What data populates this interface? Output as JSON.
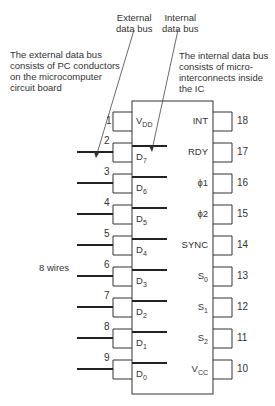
{
  "annotations": {
    "external_bus_label": [
      "External",
      "data bus"
    ],
    "internal_bus_label": [
      "Internal",
      "data bus"
    ],
    "external_note": [
      "The external data bus",
      "consists of PC conductors",
      "on the microcomputer",
      "circuit board"
    ],
    "internal_note": [
      "The internal data bus",
      "consists of micro-",
      "interconnects inside",
      "the IC"
    ],
    "wires_label": "8 wires"
  },
  "chip": {
    "left_pins": [
      {
        "num": "1",
        "name": "V",
        "sub": "DD"
      },
      {
        "num": "2",
        "name": "D",
        "sub": "7"
      },
      {
        "num": "3",
        "name": "D",
        "sub": "6"
      },
      {
        "num": "4",
        "name": "D",
        "sub": "5"
      },
      {
        "num": "5",
        "name": "D",
        "sub": "4"
      },
      {
        "num": "6",
        "name": "D",
        "sub": "3"
      },
      {
        "num": "7",
        "name": "D",
        "sub": "2"
      },
      {
        "num": "8",
        "name": "D",
        "sub": "1"
      },
      {
        "num": "9",
        "name": "D",
        "sub": "0"
      }
    ],
    "right_pins": [
      {
        "num": "18",
        "name": "INT",
        "sub": ""
      },
      {
        "num": "17",
        "name": "RDY",
        "sub": ""
      },
      {
        "num": "16",
        "name": "ϕ1",
        "sub": ""
      },
      {
        "num": "15",
        "name": "ϕ2",
        "sub": ""
      },
      {
        "num": "14",
        "name": "SYNC",
        "sub": ""
      },
      {
        "num": "13",
        "name": "S",
        "sub": "0"
      },
      {
        "num": "12",
        "name": "S",
        "sub": "1"
      },
      {
        "num": "11",
        "name": "S",
        "sub": "2"
      },
      {
        "num": "10",
        "name": "V",
        "sub": "CC"
      }
    ]
  }
}
